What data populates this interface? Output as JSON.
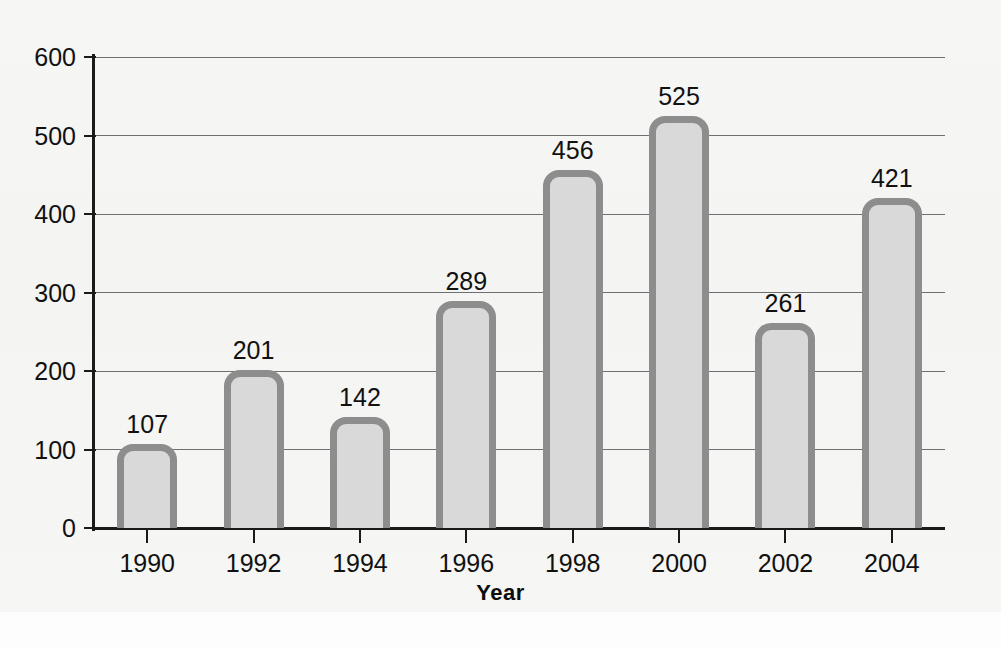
{
  "chart_data": {
    "type": "bar",
    "title": "",
    "subtitle": "",
    "xlabel": "Year",
    "ylabel": "",
    "categories": [
      "1990",
      "1992",
      "1994",
      "1996",
      "1998",
      "2000",
      "2002",
      "2004"
    ],
    "values": [
      107,
      201,
      142,
      289,
      456,
      525,
      261,
      421
    ],
    "value_labels": [
      "107",
      "201",
      "142",
      "289",
      "456",
      "525",
      "261",
      "421"
    ],
    "ylim": [
      0,
      600
    ],
    "ytick_values": [
      0,
      100,
      200,
      300,
      400,
      500,
      600
    ],
    "ytick_labels": [
      "0",
      "100",
      "200",
      "300",
      "400",
      "500",
      "600"
    ],
    "grid": true,
    "grid_axis": "y",
    "legend": "none",
    "show_data_labels": true,
    "bar_fill_color": "#d9d9d9",
    "bar_border_color": "#8d8d8d",
    "gridline_color": "#6f6f6f",
    "axis_color": "#1a1a1a",
    "text_color": "#111111",
    "background_color": "#f6f6f4"
  }
}
